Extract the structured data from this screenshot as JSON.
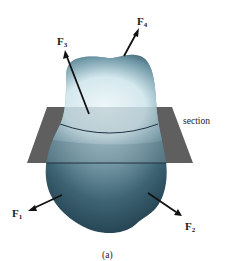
{
  "figure": {
    "caption": "(a)",
    "section_label": "section",
    "forces": [
      {
        "id": "F1",
        "symbol": "F",
        "subscript": "1"
      },
      {
        "id": "F2",
        "symbol": "F",
        "subscript": "2"
      },
      {
        "id": "F3",
        "symbol": "F",
        "subscript": "3"
      },
      {
        "id": "F4",
        "symbol": "F",
        "subscript": "4"
      }
    ],
    "colors": {
      "body_dark": "#1f4050",
      "body_light": "#e8f3f6",
      "plane": "#5e5e5e",
      "arrow": "#111111"
    }
  }
}
